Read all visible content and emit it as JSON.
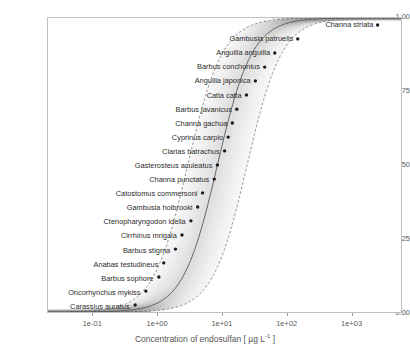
{
  "chart_data": {
    "type": "scatter",
    "title": "",
    "xlabel": "Concentration of endosulfan [ µg L⁻¹ ]",
    "ylabel": "Fraction of species affected",
    "xscale": "log",
    "xlim": [
      0.02,
      6000
    ],
    "ylim": [
      0.0,
      1.0
    ],
    "grid": false,
    "legend": null,
    "xticks": [
      "1e-01",
      "1e+00",
      "1e+01",
      "1e+02",
      "1e+03"
    ],
    "xtick_values": [
      0.1,
      1,
      10,
      100,
      1000
    ],
    "yticks": [
      "0.00",
      "0.25",
      "0.50",
      "0.75",
      "1.00"
    ],
    "ytick_values": [
      0.0,
      0.25,
      0.5,
      0.75,
      1.0
    ],
    "point_label_name": "species",
    "points": [
      {
        "species": "Channa striata",
        "x": 2600,
        "y": 0.976
      },
      {
        "species": "Gambusia patruelis",
        "x": 150,
        "y": 0.929
      },
      {
        "species": "Anguilla anguilla",
        "x": 66,
        "y": 0.881
      },
      {
        "species": "Barbus conchonius",
        "x": 46,
        "y": 0.833
      },
      {
        "species": "Anguilla japonica",
        "x": 33,
        "y": 0.786
      },
      {
        "species": "Catla catla",
        "x": 24,
        "y": 0.738
      },
      {
        "species": "Barbus javanicus",
        "x": 17,
        "y": 0.69
      },
      {
        "species": "Channa gachua",
        "x": 14.5,
        "y": 0.643
      },
      {
        "species": "Cyprinus carpio",
        "x": 12.5,
        "y": 0.595
      },
      {
        "species": "Clarias batrachus",
        "x": 11,
        "y": 0.548
      },
      {
        "species": "Gasterosteus aculeatus",
        "x": 8.5,
        "y": 0.5
      },
      {
        "species": "Channa punctatus",
        "x": 7.6,
        "y": 0.452
      },
      {
        "species": "Catostomus commersoni",
        "x": 5.0,
        "y": 0.405
      },
      {
        "species": "Gambusia holbrooki",
        "x": 4.2,
        "y": 0.357
      },
      {
        "species": "Ctenopharyngodon idella",
        "x": 3.3,
        "y": 0.31
      },
      {
        "species": "Cirrhinus mrigala",
        "x": 2.4,
        "y": 0.262
      },
      {
        "species": "Barbus stigma",
        "x": 1.9,
        "y": 0.214
      },
      {
        "species": "Anabas testudineus",
        "x": 1.25,
        "y": 0.167
      },
      {
        "species": "Barbus sophore",
        "x": 1.05,
        "y": 0.119
      },
      {
        "species": "Oncorhynchus mykiss",
        "x": 0.66,
        "y": 0.071
      },
      {
        "species": "Carassius auratus",
        "x": 0.45,
        "y": 0.024
      }
    ],
    "fit_curve": {
      "description": "log-logistic species sensitivity distribution",
      "median_mu_log10": 0.93,
      "sigma_log10": 0.62
    },
    "confidence_band": {
      "description": "bootstrap confidence band bounded by dashed curves",
      "lower_shift_log10": -0.46,
      "upper_shift_log10": 0.46,
      "fill_color": "#9e9e9e",
      "line_style": "dashed"
    },
    "point_color": "#1a1a1a",
    "curve_color": "#555555"
  },
  "axes": {
    "y_label": "Fraction of species affected",
    "x_label_prefix": "Concentration of endosulfan [ µg L",
    "x_label_exp": "-1",
    "x_label_suffix": " ]"
  }
}
